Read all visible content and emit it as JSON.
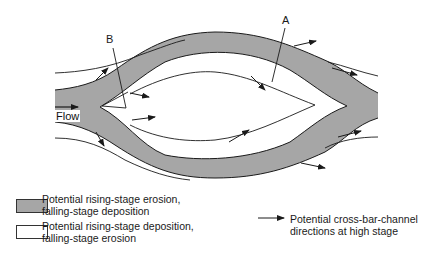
{
  "diagram": {
    "title": "",
    "labels": {
      "A": "A",
      "B": "B",
      "flow": "Flow"
    },
    "colors": {
      "erosion_fill": "#a6a6a6",
      "line": "#1a1a1a",
      "background": "#ffffff"
    }
  },
  "legend": {
    "items": [
      {
        "swatch": "gray",
        "line1": "Potential rising-stage erosion,",
        "line2": "falling-stage deposition"
      },
      {
        "swatch": "white",
        "line1": "Potential rising-stage deposition,",
        "line2": "falling-stage erosion"
      }
    ],
    "arrow_item": {
      "line1": "Potential cross-bar-channel",
      "line2": "directions at high stage"
    }
  }
}
